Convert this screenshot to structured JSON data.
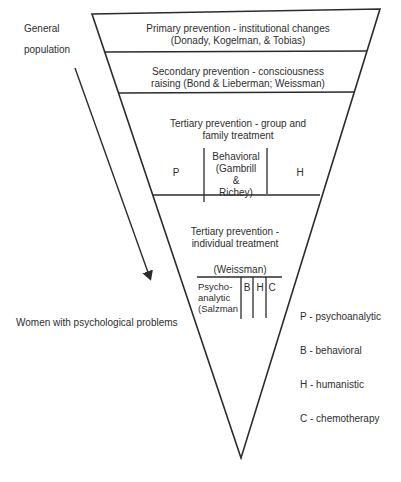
{
  "left_labels": {
    "top_line1": "General",
    "top_line2": "population",
    "bottom": "Women with psychological problems"
  },
  "levels": [
    {
      "title_line1": "Primary prevention - institutional changes",
      "title_line2": "(Donady, Kogelman, & Tobias)"
    },
    {
      "title_line1": "Secondary prevention - consciousness",
      "title_line2": "raising (Bond & Lieberman; Weissman)"
    },
    {
      "title_line1": "Tertiary prevention - group and",
      "title_line2": "family treatment",
      "columns": {
        "left": "P",
        "center_line1": "Behavioral",
        "center_line2": "(Gambrill",
        "center_line3": "&",
        "center_line4": "Richey)",
        "right": "H"
      }
    },
    {
      "title_line1": "Tertiary prevention -",
      "title_line2": "individual treatment",
      "reference": "(Weissman)",
      "columns": {
        "psycho_line1": "Psycho-",
        "psycho_line2": "analytic",
        "psycho_line3": "(Salzman",
        "b": "B",
        "h": "H",
        "c": "C"
      }
    }
  ],
  "legend": [
    {
      "key": "P",
      "text": "P - psychoanalytic"
    },
    {
      "key": "B",
      "text": "B - behavioral"
    },
    {
      "key": "H",
      "text": "H - humanistic"
    },
    {
      "key": "C",
      "text": "C - chemotherapy"
    }
  ],
  "colors": {
    "line": "#2b2b2b",
    "text": "#2e2e2e",
    "background": "#ffffff"
  }
}
